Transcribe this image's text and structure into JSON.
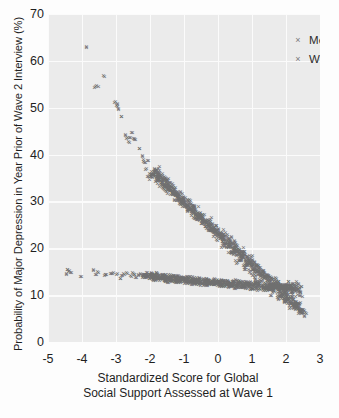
{
  "chart_data": {
    "type": "scatter",
    "title": "",
    "xlabel": "Standardized Score for Global Social Support Assessed at Wave 1",
    "xlabel_line1": "Standardized Score for Global",
    "xlabel_line2": "Social Support Assessed at Wave 1",
    "ylabel": "Probability of Major Depression in Year Prior of Wave 2 Interview (%)",
    "xlim": [
      -5,
      3
    ],
    "ylim": [
      0,
      70
    ],
    "xticks": [
      -5,
      -4,
      -3,
      -2,
      -1,
      0,
      1,
      2,
      3
    ],
    "xticklabels": [
      "-5",
      "-4",
      "-3",
      "-2",
      "-1",
      "0",
      "1",
      "2",
      "3"
    ],
    "yticks": [
      0,
      10,
      20,
      30,
      40,
      50,
      60,
      70
    ],
    "yticklabels": [
      "0",
      "10",
      "20",
      "30",
      "40",
      "50",
      "60",
      "70"
    ],
    "grid": true,
    "grid_color": "#fbfbfb",
    "panel_color": "#ebebeb",
    "marker": "x",
    "marker_color": "#6f6f6f",
    "legend_position": "top-right",
    "legend": [
      "Men",
      "Women"
    ],
    "series": [
      {
        "name": "Men",
        "marker": "x",
        "color": "#6f6f6f",
        "points": [
          [
            -4.46,
            14.3
          ],
          [
            -4.42,
            15.2
          ],
          [
            -4.38,
            15.1
          ],
          [
            -4.34,
            14.6
          ],
          [
            -4.02,
            13.8
          ],
          [
            -3.66,
            15.2
          ],
          [
            -3.6,
            14.2
          ],
          [
            -3.52,
            14.6
          ],
          [
            -3.34,
            14.0
          ],
          [
            -3.3,
            14.1
          ],
          [
            -3.12,
            14.4
          ],
          [
            -3.06,
            14.7
          ],
          [
            -2.96,
            14.4
          ],
          [
            -2.88,
            13.4
          ],
          [
            -2.82,
            14.0
          ],
          [
            -2.74,
            14.2
          ],
          [
            -2.66,
            14.5
          ],
          [
            -2.58,
            14.0
          ],
          [
            -2.52,
            14.6
          ],
          [
            -2.46,
            14.2
          ],
          [
            -2.4,
            13.5
          ],
          [
            -2.34,
            14.1
          ],
          [
            -2.28,
            14.4
          ],
          [
            -2.22,
            13.9
          ],
          [
            -2.16,
            14.2
          ],
          [
            -2.1,
            13.6
          ],
          [
            -2.06,
            14.0
          ],
          [
            -2.0,
            13.8
          ],
          [
            -1.96,
            13.6
          ],
          [
            -1.92,
            13.9
          ],
          [
            -1.88,
            13.4
          ],
          [
            -1.84,
            13.7
          ],
          [
            -1.8,
            13.5
          ],
          [
            -1.76,
            13.8
          ],
          [
            -1.72,
            13.4
          ],
          [
            -1.68,
            13.6
          ],
          [
            -1.64,
            13.3
          ],
          [
            -1.6,
            13.6
          ],
          [
            -1.56,
            13.4
          ],
          [
            -1.52,
            13.5
          ],
          [
            -1.48,
            13.2
          ],
          [
            -1.44,
            13.5
          ],
          [
            -1.4,
            13.3
          ],
          [
            -1.36,
            13.4
          ],
          [
            -1.32,
            13.1
          ],
          [
            -1.28,
            13.4
          ],
          [
            -1.24,
            13.2
          ],
          [
            -1.2,
            13.3
          ],
          [
            -1.16,
            13.0
          ],
          [
            -1.12,
            13.3
          ],
          [
            -1.08,
            13.1
          ],
          [
            -1.04,
            13.2
          ],
          [
            -1.0,
            12.9
          ],
          [
            -0.96,
            13.2
          ],
          [
            -0.92,
            13.0
          ],
          [
            -0.88,
            13.1
          ],
          [
            -0.84,
            12.8
          ],
          [
            -0.8,
            13.1
          ],
          [
            -0.76,
            12.9
          ],
          [
            -0.72,
            13.0
          ],
          [
            -0.68,
            12.7
          ],
          [
            -0.64,
            13.0
          ],
          [
            -0.6,
            12.8
          ],
          [
            -0.56,
            12.9
          ],
          [
            -0.52,
            12.6
          ],
          [
            -0.48,
            12.9
          ],
          [
            -0.44,
            12.7
          ],
          [
            -0.4,
            12.8
          ],
          [
            -0.36,
            12.5
          ],
          [
            -0.32,
            12.8
          ],
          [
            -0.28,
            12.6
          ],
          [
            -0.24,
            12.7
          ],
          [
            -0.2,
            12.4
          ],
          [
            -0.16,
            12.7
          ],
          [
            -0.12,
            12.5
          ],
          [
            -0.08,
            12.6
          ],
          [
            -0.04,
            12.3
          ],
          [
            0.0,
            12.6
          ],
          [
            0.04,
            12.4
          ],
          [
            0.08,
            12.5
          ],
          [
            0.12,
            12.2
          ],
          [
            0.16,
            12.5
          ],
          [
            0.2,
            12.3
          ],
          [
            0.24,
            12.4
          ],
          [
            0.28,
            12.1
          ],
          [
            0.32,
            12.4
          ],
          [
            0.36,
            12.2
          ],
          [
            0.4,
            12.3
          ],
          [
            0.44,
            12.0
          ],
          [
            0.48,
            12.3
          ],
          [
            0.52,
            12.1
          ],
          [
            0.56,
            12.2
          ],
          [
            0.6,
            11.9
          ],
          [
            0.64,
            12.2
          ],
          [
            0.68,
            12.0
          ],
          [
            0.72,
            12.1
          ],
          [
            0.76,
            11.8
          ],
          [
            0.8,
            12.1
          ],
          [
            0.84,
            11.9
          ],
          [
            0.88,
            12.0
          ],
          [
            0.92,
            11.7
          ],
          [
            0.96,
            12.0
          ],
          [
            1.0,
            11.8
          ],
          [
            1.06,
            11.9
          ],
          [
            1.12,
            11.6
          ],
          [
            1.18,
            11.9
          ],
          [
            1.24,
            11.7
          ],
          [
            1.3,
            11.8
          ],
          [
            1.36,
            11.5
          ],
          [
            1.42,
            11.8
          ],
          [
            1.48,
            11.6
          ],
          [
            1.54,
            11.7
          ],
          [
            1.6,
            11.4
          ],
          [
            1.66,
            11.7
          ],
          [
            1.72,
            11.5
          ],
          [
            1.78,
            11.6
          ],
          [
            1.84,
            11.3
          ],
          [
            1.9,
            11.6
          ],
          [
            1.96,
            11.4
          ],
          [
            2.02,
            11.5
          ],
          [
            2.08,
            11.2
          ],
          [
            2.14,
            11.5
          ],
          [
            2.2,
            11.0
          ],
          [
            2.26,
            11.3
          ],
          [
            2.32,
            10.8
          ],
          [
            2.38,
            12.3
          ],
          [
            2.42,
            10.3
          ],
          [
            2.1,
            11.9
          ],
          [
            2.18,
            11.6
          ],
          [
            1.98,
            12.0
          ],
          [
            1.88,
            11.9
          ]
        ]
      },
      {
        "name": "Women",
        "marker": "x",
        "color": "#6f6f6f",
        "points": [
          [
            -3.88,
            62.6
          ],
          [
            -3.6,
            54.4
          ],
          [
            -3.56,
            54.6
          ],
          [
            -3.34,
            56.4
          ],
          [
            -3.04,
            51.0
          ],
          [
            -3.0,
            50.3
          ],
          [
            -2.96,
            50.6
          ],
          [
            -2.92,
            49.6
          ],
          [
            -2.84,
            48.0
          ],
          [
            -2.72,
            44.0
          ],
          [
            -2.68,
            43.2
          ],
          [
            -2.64,
            42.6
          ],
          [
            -2.6,
            43.4
          ],
          [
            -2.52,
            44.6
          ],
          [
            -2.48,
            43.2
          ],
          [
            -2.44,
            43.0
          ],
          [
            -2.3,
            41.0
          ],
          [
            -2.22,
            39.4
          ],
          [
            -2.18,
            38.4
          ],
          [
            -2.14,
            38.2
          ],
          [
            -2.1,
            36.9
          ],
          [
            -2.06,
            38.6
          ],
          [
            -1.98,
            35.2
          ],
          [
            -1.94,
            35.6
          ],
          [
            -1.9,
            35.4
          ],
          [
            -1.86,
            36.0
          ],
          [
            -1.82,
            35.6
          ],
          [
            -1.78,
            35.2
          ],
          [
            -1.74,
            34.6
          ],
          [
            -1.7,
            34.2
          ],
          [
            -1.66,
            33.8
          ],
          [
            -1.62,
            34.6
          ],
          [
            -1.58,
            33.4
          ],
          [
            -1.54,
            33.0
          ],
          [
            -1.5,
            33.6
          ],
          [
            -1.46,
            32.6
          ],
          [
            -1.42,
            32.2
          ],
          [
            -1.38,
            32.8
          ],
          [
            -1.34,
            31.8
          ],
          [
            -1.3,
            31.4
          ],
          [
            -1.26,
            32.0
          ],
          [
            -1.22,
            31.0
          ],
          [
            -1.18,
            30.6
          ],
          [
            -1.14,
            31.2
          ],
          [
            -1.1,
            30.2
          ],
          [
            -1.06,
            29.8
          ],
          [
            -1.02,
            30.4
          ],
          [
            -0.98,
            29.4
          ],
          [
            -0.94,
            29.0
          ],
          [
            -0.9,
            29.6
          ],
          [
            -0.86,
            28.6
          ],
          [
            -0.82,
            28.2
          ],
          [
            -0.78,
            28.8
          ],
          [
            -0.74,
            27.8
          ],
          [
            -0.7,
            27.4
          ],
          [
            -0.66,
            28.0
          ],
          [
            -0.62,
            27.0
          ],
          [
            -0.58,
            26.6
          ],
          [
            -0.54,
            27.2
          ],
          [
            -0.5,
            26.2
          ],
          [
            -0.46,
            25.8
          ],
          [
            -0.42,
            26.4
          ],
          [
            -0.38,
            25.4
          ],
          [
            -0.34,
            25.0
          ],
          [
            -0.3,
            25.6
          ],
          [
            -0.26,
            24.6
          ],
          [
            -0.22,
            24.2
          ],
          [
            -0.18,
            24.8
          ],
          [
            -0.14,
            23.8
          ],
          [
            -0.1,
            23.4
          ],
          [
            -0.06,
            24.0
          ],
          [
            -0.02,
            23.0
          ],
          [
            0.02,
            22.6
          ],
          [
            0.06,
            23.2
          ],
          [
            0.1,
            22.2
          ],
          [
            0.14,
            21.8
          ],
          [
            0.18,
            22.4
          ],
          [
            0.22,
            21.4
          ],
          [
            0.26,
            21.0
          ],
          [
            0.3,
            21.6
          ],
          [
            0.34,
            20.6
          ],
          [
            0.38,
            20.2
          ],
          [
            0.42,
            20.8
          ],
          [
            0.46,
            19.8
          ],
          [
            0.5,
            19.4
          ],
          [
            0.54,
            20.0
          ],
          [
            0.58,
            19.0
          ],
          [
            0.62,
            18.6
          ],
          [
            0.66,
            19.2
          ],
          [
            0.7,
            18.2
          ],
          [
            0.74,
            17.8
          ],
          [
            0.78,
            18.4
          ],
          [
            0.82,
            17.4
          ],
          [
            0.86,
            17.0
          ],
          [
            0.9,
            17.6
          ],
          [
            0.94,
            16.6
          ],
          [
            0.98,
            16.2
          ],
          [
            1.02,
            16.8
          ],
          [
            1.06,
            15.8
          ],
          [
            1.1,
            15.4
          ],
          [
            1.14,
            16.0
          ],
          [
            1.18,
            15.0
          ],
          [
            1.22,
            14.6
          ],
          [
            1.26,
            15.2
          ],
          [
            1.3,
            14.2
          ],
          [
            1.34,
            13.8
          ],
          [
            1.38,
            14.4
          ],
          [
            1.42,
            13.4
          ],
          [
            1.46,
            13.0
          ],
          [
            1.5,
            13.6
          ],
          [
            1.54,
            12.6
          ],
          [
            1.58,
            12.2
          ],
          [
            1.62,
            12.8
          ],
          [
            1.66,
            11.8
          ],
          [
            1.7,
            11.4
          ],
          [
            1.74,
            12.0
          ],
          [
            1.78,
            11.0
          ],
          [
            1.82,
            10.6
          ],
          [
            1.86,
            11.2
          ],
          [
            1.9,
            10.2
          ],
          [
            1.94,
            9.8
          ],
          [
            1.98,
            10.4
          ],
          [
            2.02,
            9.4
          ],
          [
            2.06,
            9.0
          ],
          [
            2.1,
            9.6
          ],
          [
            2.14,
            8.6
          ],
          [
            2.18,
            8.2
          ],
          [
            2.22,
            8.8
          ],
          [
            2.26,
            7.8
          ],
          [
            2.3,
            7.4
          ],
          [
            2.34,
            8.0
          ],
          [
            2.38,
            6.9
          ],
          [
            2.42,
            6.5
          ],
          [
            2.46,
            6.1
          ],
          [
            2.5,
            6.0
          ],
          [
            -1.8,
            36.6
          ],
          [
            -1.66,
            35.0
          ],
          [
            -1.52,
            34.0
          ],
          [
            -1.4,
            33.2
          ],
          [
            -1.2,
            31.6
          ],
          [
            -1.0,
            30.0
          ],
          [
            -0.8,
            28.4
          ],
          [
            -0.6,
            26.8
          ],
          [
            -0.4,
            25.2
          ],
          [
            -0.2,
            23.6
          ],
          [
            0.0,
            22.0
          ],
          [
            0.2,
            20.4
          ],
          [
            0.4,
            18.8
          ],
          [
            0.6,
            17.2
          ],
          [
            0.8,
            15.6
          ],
          [
            1.0,
            14.0
          ],
          [
            1.2,
            12.6
          ],
          [
            1.4,
            11.4
          ],
          [
            1.6,
            10.4
          ],
          [
            1.8,
            9.4
          ],
          [
            2.0,
            8.5
          ],
          [
            2.2,
            7.6
          ],
          [
            2.4,
            6.8
          ]
        ]
      }
    ]
  }
}
